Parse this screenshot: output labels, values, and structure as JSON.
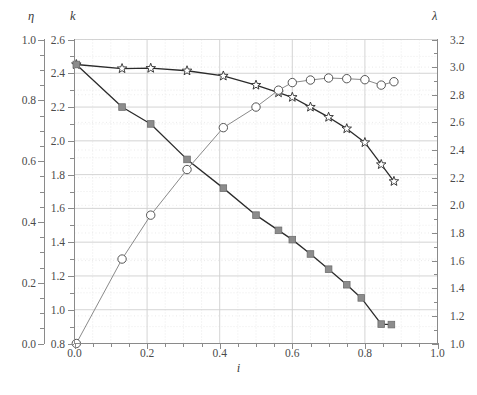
{
  "figure": {
    "caption_partial": ""
  },
  "axes": {
    "eta": {
      "title": "η",
      "name": "eta",
      "min": 0.0,
      "max": 1.0,
      "ticks": [
        "0.0",
        "0.2",
        "0.4",
        "0.6",
        "0.8",
        "1.0"
      ],
      "tick_values": [
        0.0,
        0.2,
        0.4,
        0.6,
        0.8,
        1.0
      ],
      "minor_step": 0.05,
      "position": "far-left"
    },
    "k": {
      "title": "k",
      "name": "k",
      "min": 0.8,
      "max": 2.6,
      "ticks": [
        "0.8",
        "1.0",
        "1.2",
        "1.4",
        "1.6",
        "1.8",
        "2.0",
        "2.2",
        "2.4",
        "2.6"
      ],
      "tick_values": [
        0.8,
        1.0,
        1.2,
        1.4,
        1.6,
        1.8,
        2.0,
        2.2,
        2.4,
        2.6
      ],
      "minor_step": 0.1,
      "position": "left"
    },
    "lambda": {
      "title": "λ",
      "name": "lambda",
      "min": 1.0,
      "max": 3.2,
      "ticks": [
        "1.0",
        "1.2",
        "1.4",
        "1.6",
        "1.8",
        "2.0",
        "2.2",
        "2.4",
        "2.6",
        "2.8",
        "3.0",
        "3.2"
      ],
      "tick_values": [
        1.0,
        1.2,
        1.4,
        1.6,
        1.8,
        2.0,
        2.2,
        2.4,
        2.6,
        2.8,
        3.0,
        3.2
      ],
      "minor_step": 0.1,
      "position": "right"
    },
    "i": {
      "title": "i",
      "name": "i",
      "min": 0.0,
      "max": 1.0,
      "ticks": [
        "0.0",
        "0.2",
        "0.4",
        "0.6",
        "0.8",
        "1.0"
      ],
      "tick_values": [
        0.0,
        0.2,
        0.4,
        0.6,
        0.8,
        1.0
      ],
      "minor_step": 0.05,
      "position": "bottom"
    }
  },
  "colors": {
    "star_line": "#2b2b2b",
    "star_marker_fill": "#ffffff",
    "star_marker_edge": "#2b2b2b",
    "square_line": "#2b2b2b",
    "square_marker_fill": "#8c8c8c",
    "square_marker_edge": "#6e6e6e",
    "circle_line": "#8a8a8a",
    "circle_marker_fill": "#ffffff",
    "circle_marker_edge": "#555555",
    "axis": "#8a8a8a",
    "grid_major": "#cfcfcf",
    "grid_minor": "#dedede",
    "text": "#3a3a3a"
  },
  "chart_data": {
    "type": "line",
    "title": "",
    "subtitle": "",
    "xlabel": "i",
    "ylabel": "k",
    "y2label": "λ",
    "y3label": "η",
    "xlim": [
      0.0,
      1.0
    ],
    "ylim": [
      0.8,
      2.6
    ],
    "y2lim": [
      1.0,
      3.2
    ],
    "y3lim": [
      0.0,
      1.0
    ],
    "grid": true,
    "grid_major": true,
    "grid_minor": true,
    "legend": "none",
    "legend_position": "none",
    "annotations": [],
    "series": [
      {
        "name": "star-series",
        "marker": "star-open",
        "line_color": "#2b2b2b",
        "axis": "k",
        "x": [
          0.005,
          0.131,
          0.21,
          0.31,
          0.41,
          0.5,
          0.562,
          0.6,
          0.65,
          0.7,
          0.75,
          0.8,
          0.845,
          0.88
        ],
        "y": [
          2.452,
          2.428,
          2.43,
          2.415,
          2.384,
          2.33,
          2.285,
          2.258,
          2.2,
          2.14,
          2.072,
          1.99,
          1.86,
          1.76
        ],
        "values": [
          2.452,
          2.428,
          2.43,
          2.415,
          2.384,
          2.33,
          2.285,
          2.258,
          2.2,
          2.14,
          2.072,
          1.99,
          1.86,
          1.76
        ]
      },
      {
        "name": "square-series",
        "marker": "square-filled",
        "line_color": "#2b2b2b",
        "axis": "k",
        "x": [
          0.005,
          0.131,
          0.21,
          0.31,
          0.41,
          0.5,
          0.562,
          0.6,
          0.65,
          0.7,
          0.75,
          0.79,
          0.845,
          0.873
        ],
        "y": [
          2.452,
          2.2,
          2.1,
          1.89,
          1.72,
          1.56,
          1.47,
          1.415,
          1.33,
          1.24,
          1.148,
          1.07,
          0.915,
          0.912
        ],
        "values": [
          2.452,
          2.2,
          2.1,
          1.89,
          1.72,
          1.56,
          1.47,
          1.415,
          1.33,
          1.24,
          1.148,
          1.07,
          0.915,
          0.912
        ]
      },
      {
        "name": "circle-series",
        "marker": "circle-open",
        "line_color": "#8a8a8a",
        "axis": "k",
        "x": [
          0.005,
          0.131,
          0.21,
          0.31,
          0.41,
          0.5,
          0.562,
          0.6,
          0.65,
          0.7,
          0.75,
          0.8,
          0.845,
          0.88
        ],
        "y": [
          0.8,
          1.3,
          1.56,
          1.83,
          2.078,
          2.2,
          2.3,
          2.345,
          2.36,
          2.372,
          2.368,
          2.362,
          2.33,
          2.35
        ],
        "values": [
          0.8,
          1.3,
          1.56,
          1.83,
          2.078,
          2.2,
          2.3,
          2.345,
          2.36,
          2.372,
          2.368,
          2.362,
          2.33,
          2.35
        ]
      }
    ]
  }
}
